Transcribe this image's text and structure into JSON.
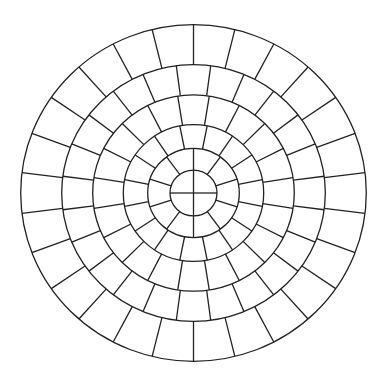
{
  "diagram": {
    "type": "concentric-circular-paving-pattern",
    "background_color": "#ffffff",
    "line_color": "#222222",
    "center": {
      "x": 193.5,
      "y": 193
    },
    "vertical_scale": 0.974,
    "circle_radii": [
      23.5,
      45.8,
      70.2,
      100.8,
      131.8,
      172.8
    ],
    "rings": [
      {
        "name": "center-disc",
        "inner_radius": 0,
        "outer_radius": 23.5,
        "segments": 4,
        "start_angle_deg": 0
      },
      {
        "name": "ring-2",
        "inner_radius": 23.5,
        "outer_radius": 45.8,
        "segments": 10,
        "start_angle_deg": 0
      },
      {
        "name": "ring-3",
        "inner_radius": 45.8,
        "outer_radius": 70.2,
        "segments": 16,
        "start_angle_deg": 11.25
      },
      {
        "name": "ring-4",
        "inner_radius": 70.2,
        "outer_radius": 100.8,
        "segments": 20,
        "start_angle_deg": 9
      },
      {
        "name": "ring-5",
        "inner_radius": 100.8,
        "outer_radius": 131.8,
        "segments": 24,
        "start_angle_deg": 7.5
      },
      {
        "name": "ring-6",
        "inner_radius": 131.8,
        "outer_radius": 172.8,
        "segments": 26,
        "start_angle_deg": 0
      }
    ]
  }
}
